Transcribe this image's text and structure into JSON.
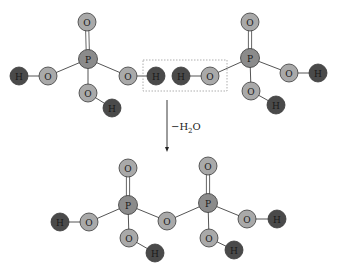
{
  "colors": {
    "O": "#a9a9a9",
    "P": "#8b8b8b",
    "H": "#4a4a4a",
    "bond": "#555555",
    "box": "#9a9a9a",
    "atom_stroke": "#3a3a3a"
  },
  "reaction": {
    "label_prefix": "−H",
    "label_sub": "2",
    "label_suffix": "O"
  },
  "atoms": [
    {
      "id": "a1",
      "el": "O",
      "x": 87,
      "y": 22
    },
    {
      "id": "a2",
      "el": "P",
      "x": 88,
      "y": 59
    },
    {
      "id": "a3",
      "el": "O",
      "x": 48,
      "y": 76
    },
    {
      "id": "a4",
      "el": "H",
      "x": 19,
      "y": 76
    },
    {
      "id": "a5",
      "el": "O",
      "x": 88,
      "y": 93
    },
    {
      "id": "a6",
      "el": "H",
      "x": 112,
      "y": 108
    },
    {
      "id": "a7",
      "el": "O",
      "x": 128,
      "y": 76
    },
    {
      "id": "a8",
      "el": "H",
      "x": 156,
      "y": 76
    },
    {
      "id": "a9",
      "el": "H",
      "x": 181,
      "y": 76
    },
    {
      "id": "a10",
      "el": "O",
      "x": 210,
      "y": 76
    },
    {
      "id": "a11",
      "el": "O",
      "x": 250,
      "y": 22
    },
    {
      "id": "a12",
      "el": "P",
      "x": 250,
      "y": 58
    },
    {
      "id": "a13",
      "el": "O",
      "x": 289,
      "y": 73
    },
    {
      "id": "a14",
      "el": "H",
      "x": 318,
      "y": 73
    },
    {
      "id": "a15",
      "el": "O",
      "x": 251,
      "y": 91
    },
    {
      "id": "a16",
      "el": "H",
      "x": 276,
      "y": 105
    },
    {
      "id": "b1",
      "el": "O",
      "x": 128,
      "y": 168
    },
    {
      "id": "b2",
      "el": "P",
      "x": 128,
      "y": 205
    },
    {
      "id": "b3",
      "el": "O",
      "x": 89,
      "y": 222
    },
    {
      "id": "b4",
      "el": "H",
      "x": 60,
      "y": 222
    },
    {
      "id": "b5",
      "el": "O",
      "x": 129,
      "y": 238
    },
    {
      "id": "b6",
      "el": "H",
      "x": 155,
      "y": 253
    },
    {
      "id": "b7",
      "el": "O",
      "x": 167,
      "y": 221
    },
    {
      "id": "b8",
      "el": "O",
      "x": 208,
      "y": 166
    },
    {
      "id": "b9",
      "el": "P",
      "x": 208,
      "y": 203
    },
    {
      "id": "b10",
      "el": "O",
      "x": 247,
      "y": 219
    },
    {
      "id": "b11",
      "el": "H",
      "x": 277,
      "y": 219
    },
    {
      "id": "b12",
      "el": "O",
      "x": 209,
      "y": 238
    },
    {
      "id": "b13",
      "el": "H",
      "x": 234,
      "y": 250
    }
  ],
  "bonds": [
    {
      "a": "a1",
      "b": "a2",
      "order": 2
    },
    {
      "a": "a2",
      "b": "a3",
      "order": 1
    },
    {
      "a": "a3",
      "b": "a4",
      "order": 1
    },
    {
      "a": "a2",
      "b": "a5",
      "order": 1
    },
    {
      "a": "a5",
      "b": "a6",
      "order": 1
    },
    {
      "a": "a2",
      "b": "a7",
      "order": 1
    },
    {
      "a": "a7",
      "b": "a8",
      "order": 1
    },
    {
      "a": "a9",
      "b": "a10",
      "order": 1
    },
    {
      "a": "a10",
      "b": "a12",
      "order": 1
    },
    {
      "a": "a11",
      "b": "a12",
      "order": 2
    },
    {
      "a": "a12",
      "b": "a13",
      "order": 1
    },
    {
      "a": "a13",
      "b": "a14",
      "order": 1
    },
    {
      "a": "a12",
      "b": "a15",
      "order": 1
    },
    {
      "a": "a15",
      "b": "a16",
      "order": 1
    },
    {
      "a": "b1",
      "b": "b2",
      "order": 2
    },
    {
      "a": "b2",
      "b": "b3",
      "order": 1
    },
    {
      "a": "b3",
      "b": "b4",
      "order": 1
    },
    {
      "a": "b2",
      "b": "b5",
      "order": 1
    },
    {
      "a": "b5",
      "b": "b6",
      "order": 1
    },
    {
      "a": "b2",
      "b": "b7",
      "order": 1
    },
    {
      "a": "b7",
      "b": "b9",
      "order": 1
    },
    {
      "a": "b8",
      "b": "b9",
      "order": 2
    },
    {
      "a": "b9",
      "b": "b10",
      "order": 1
    },
    {
      "a": "b10",
      "b": "b11",
      "order": 1
    },
    {
      "a": "b9",
      "b": "b12",
      "order": 1
    },
    {
      "a": "b12",
      "b": "b13",
      "order": 1
    }
  ],
  "highlight_box": {
    "x": 143,
    "y": 60,
    "w": 84,
    "h": 31
  },
  "arrow": {
    "x": 167,
    "y1": 100,
    "y2": 152
  }
}
